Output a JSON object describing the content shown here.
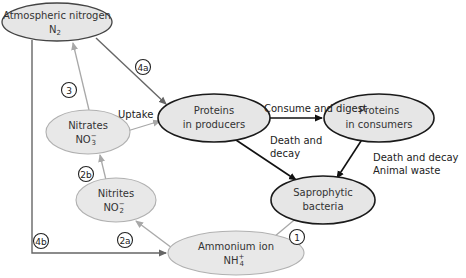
{
  "diagram": {
    "nodes": {
      "atmospheric": {
        "line1": "Atmospheric nitrogen",
        "formula": "N",
        "sub": "2",
        "sup": ""
      },
      "nitrates": {
        "line1": "Nitrates",
        "formula": "NO",
        "sub": "3",
        "sup": "−"
      },
      "nitrites": {
        "line1": "Nitrites",
        "formula": "NO",
        "sub": "2",
        "sup": "−"
      },
      "ammonium": {
        "line1": "Ammonium ion",
        "formula": "NH",
        "sub": "4",
        "sup": "+"
      },
      "producers": {
        "line1": "Proteins",
        "line2": "in producers"
      },
      "consumers": {
        "line1": "Proteins",
        "line2": "in consumers"
      },
      "bacteria": {
        "line1": "Saprophytic",
        "line2": "bacteria"
      }
    },
    "edge_labels": {
      "uptake": "Uptake",
      "consume": "Consume and digest",
      "death_producers_1": "Death and",
      "death_producers_2": "decay",
      "death_consumers_1": "Death and decay",
      "death_consumers_2": "Animal waste"
    },
    "markers": {
      "m1": "1",
      "m2a": "2a",
      "m2b": "2b",
      "m3": "3",
      "m4a": "4a",
      "m4b": "4b"
    },
    "colors": {
      "ellipse_fill_bold": "#e6e6e6",
      "ellipse_fill_light": "#e8e8e8",
      "bold_stroke": "#1a1a1a",
      "light_stroke": "#9a9a9a",
      "mid_arrow": "#666666",
      "light_arrow": "#a8a8a8"
    }
  }
}
